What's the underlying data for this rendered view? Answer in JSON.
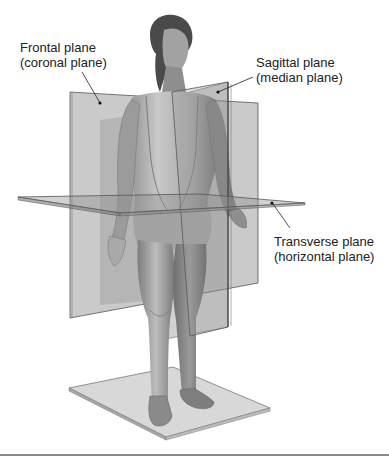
{
  "figure": {
    "labels": {
      "frontal": {
        "line1": "Frontal plane",
        "line2": "(coronal plane)"
      },
      "sagittal": {
        "line1": "Sagittal plane",
        "line2": "(median plane)"
      },
      "transverse": {
        "line1": "Transverse plane",
        "line2": "(horizontal plane)"
      }
    },
    "colors": {
      "plane_fill": "#9a9a9a",
      "plane_edge": "#5a5a5a",
      "skin_light": "#c8c8c8",
      "skin_dark": "#6e6e6e",
      "floor": "#d6d6d6",
      "text": "#222222",
      "rule": "#8a8a8a"
    }
  }
}
